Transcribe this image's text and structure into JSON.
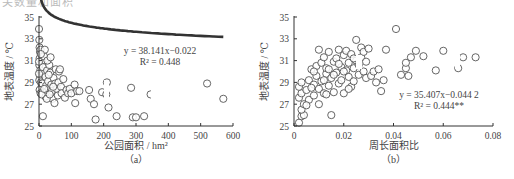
{
  "page": {
    "top_cut_text": "关数量和面积"
  },
  "chart_data": [
    {
      "type": "scatter",
      "panel_label": "（a）",
      "title": "",
      "xlabel": "公园面积 / hm²",
      "ylabel": "地表温度 / ℃",
      "xlim": [
        0,
        600
      ],
      "ylim": [
        25,
        35
      ],
      "xticks": [
        0,
        100,
        200,
        300,
        400,
        500,
        600
      ],
      "yticks": [
        25,
        27,
        29,
        31,
        33,
        35
      ],
      "grid": false,
      "legend": null,
      "annotation": {
        "equation": "y = 38.141x−0.022",
        "r2": "R² = 0.448"
      },
      "fit": {
        "form": "power",
        "a": 38.141,
        "b": -0.022,
        "x_range": [
          1,
          570
        ],
        "style": "dashed"
      },
      "points": [
        [
          0,
          33.9
        ],
        [
          1,
          32.9
        ],
        [
          2,
          32.2
        ],
        [
          3,
          31.8
        ],
        [
          5,
          32.0
        ],
        [
          2,
          31.2
        ],
        [
          1,
          30.6
        ],
        [
          4,
          30.1
        ],
        [
          3,
          29.6
        ],
        [
          1,
          29.2
        ],
        [
          6,
          29.0
        ],
        [
          8,
          28.6
        ],
        [
          2,
          28.3
        ],
        [
          5,
          28.0
        ],
        [
          10,
          31.0
        ],
        [
          12,
          30.4
        ],
        [
          15,
          31.4
        ],
        [
          18,
          32.0
        ],
        [
          14,
          29.8
        ],
        [
          10,
          28.9
        ],
        [
          12,
          25.9
        ],
        [
          20,
          29.5
        ],
        [
          22,
          28.7
        ],
        [
          25,
          30.1
        ],
        [
          28,
          29.1
        ],
        [
          30,
          28.4
        ],
        [
          20,
          27.7
        ],
        [
          32,
          30.6
        ],
        [
          35,
          29.9
        ],
        [
          38,
          28.8
        ],
        [
          40,
          28.2
        ],
        [
          42,
          27.5
        ],
        [
          45,
          29.4
        ],
        [
          48,
          27.1
        ],
        [
          50,
          28.9
        ],
        [
          52,
          30.2
        ],
        [
          55,
          28.4
        ],
        [
          58,
          27.8
        ],
        [
          60,
          29.0
        ],
        [
          62,
          30.0
        ],
        [
          65,
          30.2
        ],
        [
          68,
          28.6
        ],
        [
          70,
          28.0
        ],
        [
          75,
          29.3
        ],
        [
          80,
          27.6
        ],
        [
          85,
          28.3
        ],
        [
          90,
          28.0
        ],
        [
          95,
          28.4
        ],
        [
          100,
          28.0
        ],
        [
          110,
          28.8
        ],
        [
          112,
          27.1
        ],
        [
          118,
          28.2
        ],
        [
          125,
          28.2
        ],
        [
          155,
          28.3
        ],
        [
          160,
          27.5
        ],
        [
          170,
          27.0
        ],
        [
          175,
          25.6
        ],
        [
          195,
          28.1
        ],
        [
          210,
          29.0
        ],
        [
          208,
          27.9
        ],
        [
          215,
          26.7
        ],
        [
          240,
          25.9
        ],
        [
          285,
          28.5
        ],
        [
          290,
          25.8
        ],
        [
          300,
          25.8
        ],
        [
          325,
          25.9
        ],
        [
          345,
          27.9
        ],
        [
          520,
          28.9
        ],
        [
          570,
          27.5
        ],
        [
          8,
          27.9
        ],
        [
          16,
          28.4
        ],
        [
          24,
          27.5
        ],
        [
          33,
          27.9
        ],
        [
          44,
          28.6
        ],
        [
          26,
          31.0
        ],
        [
          36,
          31.3
        ],
        [
          0,
          30.9
        ],
        [
          0,
          29.8
        ],
        [
          6,
          31.6
        ],
        [
          30,
          29.7
        ]
      ]
    },
    {
      "type": "scatter",
      "panel_label": "（b）",
      "title": "",
      "xlabel": "周长面积比",
      "ylabel": "地表温度 / ℃",
      "xlim": [
        0,
        0.08
      ],
      "ylim": [
        25,
        35
      ],
      "xticks": [
        0,
        0.02,
        0.04,
        0.06,
        0.08
      ],
      "yticks": [
        25,
        27,
        29,
        31,
        33,
        35
      ],
      "grid": false,
      "legend": null,
      "annotation": {
        "equation": "y = 35.407x−0.044 2",
        "r2": "R² = 0.444**"
      },
      "fit": {
        "form": "power",
        "a": 35.407,
        "b": -0.0442,
        "x_range": [
          0.0025,
          0.074
        ],
        "style": "dashed"
      },
      "points": [
        [
          0.002,
          25.3
        ],
        [
          0.003,
          25.9
        ],
        [
          0.004,
          26.0
        ],
        [
          0.003,
          26.5
        ],
        [
          0.004,
          27.0
        ],
        [
          0.002,
          27.6
        ],
        [
          0.003,
          28.0
        ],
        [
          0.002,
          28.6
        ],
        [
          0.003,
          29.0
        ],
        [
          0.005,
          28.3
        ],
        [
          0.006,
          27.4
        ],
        [
          0.006,
          29.2
        ],
        [
          0.007,
          30.2
        ],
        [
          0.008,
          28.8
        ],
        [
          0.008,
          27.8
        ],
        [
          0.009,
          29.6
        ],
        [
          0.009,
          30.5
        ],
        [
          0.01,
          27.0
        ],
        [
          0.01,
          28.4
        ],
        [
          0.01,
          32.0
        ],
        [
          0.011,
          29.1
        ],
        [
          0.011,
          30.8
        ],
        [
          0.012,
          31.3
        ],
        [
          0.012,
          28.0
        ],
        [
          0.013,
          29.8
        ],
        [
          0.013,
          30.3
        ],
        [
          0.014,
          31.8
        ],
        [
          0.014,
          28.7
        ],
        [
          0.015,
          26.0
        ],
        [
          0.015,
          29.4
        ],
        [
          0.016,
          30.9
        ],
        [
          0.016,
          28.1
        ],
        [
          0.017,
          29.9
        ],
        [
          0.017,
          31.2
        ],
        [
          0.018,
          32.0
        ],
        [
          0.018,
          28.9
        ],
        [
          0.019,
          30.4
        ],
        [
          0.019,
          29.2
        ],
        [
          0.02,
          31.5
        ],
        [
          0.02,
          28.0
        ],
        [
          0.021,
          30.1
        ],
        [
          0.021,
          31.9
        ],
        [
          0.022,
          29.5
        ],
        [
          0.022,
          30.8
        ],
        [
          0.023,
          31.6
        ],
        [
          0.023,
          28.6
        ],
        [
          0.024,
          30.3
        ],
        [
          0.024,
          29.1
        ],
        [
          0.025,
          32.9
        ],
        [
          0.025,
          31.0
        ],
        [
          0.026,
          30.6
        ],
        [
          0.026,
          29.7
        ],
        [
          0.027,
          32.2
        ],
        [
          0.027,
          31.3
        ],
        [
          0.028,
          30.0
        ],
        [
          0.028,
          31.8
        ],
        [
          0.029,
          30.9
        ],
        [
          0.029,
          29.4
        ],
        [
          0.03,
          32.1
        ],
        [
          0.031,
          29.6
        ],
        [
          0.032,
          30.0
        ],
        [
          0.033,
          29.0
        ],
        [
          0.034,
          30.2
        ],
        [
          0.035,
          28.2
        ],
        [
          0.036,
          29.2
        ],
        [
          0.037,
          32.0
        ],
        [
          0.041,
          33.9
        ],
        [
          0.043,
          29.7
        ],
        [
          0.045,
          30.3
        ],
        [
          0.045,
          30.8
        ],
        [
          0.046,
          29.6
        ],
        [
          0.047,
          31.3
        ],
        [
          0.049,
          31.9
        ],
        [
          0.052,
          31.4
        ],
        [
          0.057,
          30.1
        ],
        [
          0.06,
          31.9
        ],
        [
          0.066,
          30.3
        ],
        [
          0.068,
          31.3
        ],
        [
          0.073,
          31.3
        ],
        [
          0.005,
          26.9
        ],
        [
          0.007,
          28.5
        ],
        [
          0.012,
          29.2
        ],
        [
          0.014,
          30.2
        ],
        [
          0.016,
          29.7
        ],
        [
          0.018,
          30.7
        ],
        [
          0.02,
          30.0
        ],
        [
          0.022,
          28.4
        ],
        [
          0.024,
          31.2
        ],
        [
          0.008,
          30.0
        ],
        [
          0.013,
          27.9
        ]
      ]
    }
  ]
}
